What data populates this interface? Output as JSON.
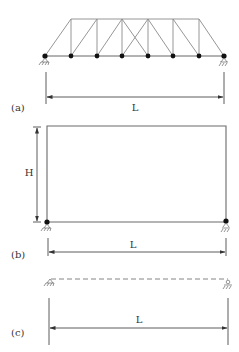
{
  "panels": [
    {
      "id": "a",
      "label": "(a)",
      "structure": "truss",
      "dimension_label": "L",
      "bottom_nodes_x": [
        45,
        71,
        97,
        122,
        148,
        173,
        199,
        224
      ],
      "top_nodes_x": [
        71,
        97,
        122,
        148,
        173,
        199
      ]
    },
    {
      "id": "b",
      "label": "(b)",
      "structure": "portal frame",
      "dimension_label_width": "L",
      "dimension_label_height": "H"
    },
    {
      "id": "c",
      "label": "(c)",
      "structure": "simply supported beam (dashed)",
      "dimension_label": "L"
    }
  ],
  "colors": {
    "line": "#8a8a8a",
    "node": "#111111",
    "text": "#333333"
  }
}
